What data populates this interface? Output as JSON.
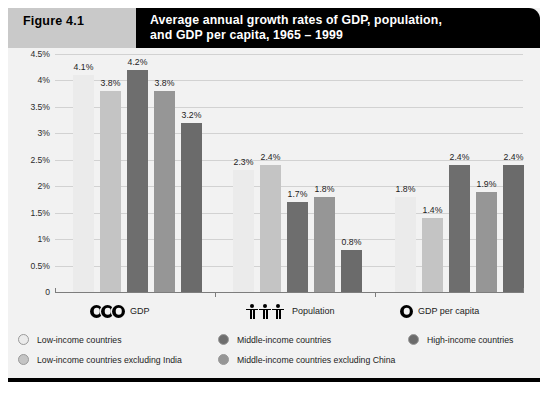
{
  "figure": {
    "number_label": "Figure 4.1",
    "title_line1": "Average annual growth rates of GDP, population,",
    "title_line2": "and GDP per capita, 1965 –  1999"
  },
  "chart_data": {
    "type": "bar",
    "title": "Average annual growth rates of GDP, population, and GDP per capita, 1965 – 1999",
    "xlabel": "",
    "ylabel": "",
    "ylim": [
      0,
      4.5
    ],
    "grid": true,
    "legend_position": "bottom",
    "categories": [
      "GDP",
      "Population",
      "GDP per capita"
    ],
    "category_icons": [
      "coins-icon",
      "people-icon",
      "coin-icon"
    ],
    "ytick_labels": [
      "0",
      "0.5%",
      "1%",
      "1.5%",
      "2%",
      "2.5%",
      "3%",
      "3.5%",
      "4%",
      "4.5%"
    ],
    "ytick_values": [
      0,
      0.5,
      1,
      1.5,
      2,
      2.5,
      3,
      3.5,
      4,
      4.5
    ],
    "series": [
      {
        "name": "Low-income countries",
        "color": "#ebebeb",
        "values": [
          4.1,
          2.3,
          1.8
        ],
        "labels": [
          "4.1%",
          "2.3%",
          "1.8%"
        ]
      },
      {
        "name": "Low-income countries excluding India",
        "color": "#c4c4c4",
        "values": [
          3.8,
          2.4,
          1.4
        ],
        "labels": [
          "3.8%",
          "2.4%",
          "1.4%"
        ]
      },
      {
        "name": "Middle-income countries",
        "color": "#6e6e6e",
        "values": [
          4.2,
          1.7,
          2.4
        ],
        "labels": [
          "4.2%",
          "1.7%",
          "2.4%"
        ]
      },
      {
        "name": "Middle-income countries excluding China",
        "color": "#969696",
        "values": [
          3.8,
          1.8,
          1.9
        ],
        "labels": [
          "3.8%",
          "1.8%",
          "1.9%"
        ]
      },
      {
        "name": "High-income countries",
        "color": "#6b6b6b",
        "values": [
          3.2,
          0.8,
          2.4
        ],
        "labels": [
          "3.2%",
          "0.8%",
          "2.4%"
        ]
      }
    ]
  },
  "legend": {
    "items": [
      {
        "label": "Low-income countries",
        "color": "#ebebeb"
      },
      {
        "label": "Middle-income countries",
        "color": "#6e6e6e"
      },
      {
        "label": "High-income countries",
        "color": "#6b6b6b"
      },
      {
        "label": "Low-income countries excluding India",
        "color": "#c4c4c4"
      },
      {
        "label": "Middle-income countries excluding China",
        "color": "#969696"
      }
    ]
  }
}
